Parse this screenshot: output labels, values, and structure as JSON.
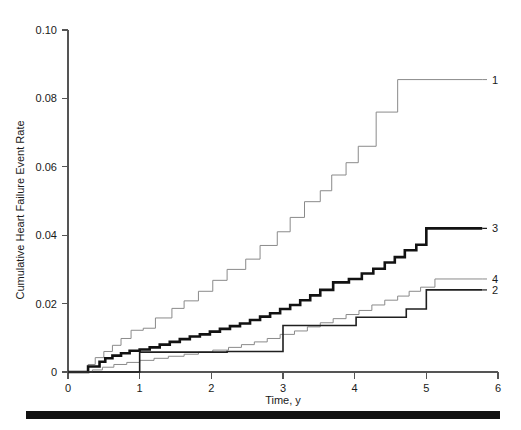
{
  "chart_data": {
    "type": "line",
    "subtype": "kaplan-meier-cumulative-event-step",
    "title": "",
    "xlabel": "Time, y",
    "ylabel": "Cumulative Heart Failure Event Rate",
    "xlim": [
      0,
      6
    ],
    "ylim": [
      0,
      0.1
    ],
    "xticks": [
      0,
      1,
      2,
      3,
      4,
      5,
      6
    ],
    "xticklabels": [
      "0",
      "1",
      "2",
      "3",
      "4",
      "5",
      "6"
    ],
    "yticks": [
      0,
      0.02,
      0.04,
      0.06,
      0.08,
      0.1
    ],
    "yticklabels": [
      "0",
      "0.02",
      "0.04",
      "0.06",
      "0.08",
      "0.10"
    ],
    "grid": false,
    "legend_position": "right-of-curve-ends",
    "series": [
      {
        "name": "1",
        "label": "1",
        "color": "#8a8a8a",
        "linewidth": 1.0,
        "final_value": 0.0855,
        "points": [
          [
            0.0,
            0.0
          ],
          [
            0.28,
            0.0
          ],
          [
            0.28,
            0.0022
          ],
          [
            0.38,
            0.0022
          ],
          [
            0.38,
            0.0042
          ],
          [
            0.5,
            0.0042
          ],
          [
            0.5,
            0.006
          ],
          [
            0.62,
            0.006
          ],
          [
            0.62,
            0.0078
          ],
          [
            0.74,
            0.0078
          ],
          [
            0.74,
            0.0098
          ],
          [
            0.88,
            0.0098
          ],
          [
            0.88,
            0.0122
          ],
          [
            1.05,
            0.0122
          ],
          [
            1.05,
            0.0128
          ],
          [
            1.22,
            0.0128
          ],
          [
            1.22,
            0.0158
          ],
          [
            1.45,
            0.0158
          ],
          [
            1.45,
            0.0186
          ],
          [
            1.62,
            0.0186
          ],
          [
            1.62,
            0.0208
          ],
          [
            1.82,
            0.0208
          ],
          [
            1.82,
            0.0236
          ],
          [
            2.02,
            0.0236
          ],
          [
            2.02,
            0.0268
          ],
          [
            2.22,
            0.0268
          ],
          [
            2.22,
            0.03
          ],
          [
            2.48,
            0.03
          ],
          [
            2.48,
            0.033
          ],
          [
            2.68,
            0.033
          ],
          [
            2.68,
            0.037
          ],
          [
            2.92,
            0.037
          ],
          [
            2.92,
            0.041
          ],
          [
            3.1,
            0.041
          ],
          [
            3.1,
            0.0452
          ],
          [
            3.3,
            0.0452
          ],
          [
            3.3,
            0.0498
          ],
          [
            3.52,
            0.0498
          ],
          [
            3.52,
            0.053
          ],
          [
            3.68,
            0.053
          ],
          [
            3.68,
            0.0576
          ],
          [
            3.88,
            0.0576
          ],
          [
            3.88,
            0.0612
          ],
          [
            4.05,
            0.0612
          ],
          [
            4.05,
            0.066
          ],
          [
            4.3,
            0.066
          ],
          [
            4.3,
            0.076
          ],
          [
            4.6,
            0.076
          ],
          [
            4.6,
            0.0855
          ],
          [
            5.78,
            0.0855
          ]
        ]
      },
      {
        "name": "3",
        "label": "3",
        "color": "#121212",
        "linewidth": 2.6,
        "final_value": 0.042,
        "points": [
          [
            0.0,
            0.0
          ],
          [
            0.28,
            0.0
          ],
          [
            0.28,
            0.0016
          ],
          [
            0.44,
            0.0016
          ],
          [
            0.44,
            0.003
          ],
          [
            0.52,
            0.003
          ],
          [
            0.52,
            0.004
          ],
          [
            0.62,
            0.004
          ],
          [
            0.62,
            0.0048
          ],
          [
            0.74,
            0.0048
          ],
          [
            0.74,
            0.0055
          ],
          [
            0.86,
            0.0055
          ],
          [
            0.86,
            0.0062
          ],
          [
            1.0,
            0.0062
          ],
          [
            1.0,
            0.0066
          ],
          [
            1.14,
            0.0066
          ],
          [
            1.14,
            0.0072
          ],
          [
            1.28,
            0.0072
          ],
          [
            1.28,
            0.008
          ],
          [
            1.42,
            0.008
          ],
          [
            1.42,
            0.0088
          ],
          [
            1.56,
            0.0088
          ],
          [
            1.56,
            0.0096
          ],
          [
            1.7,
            0.0096
          ],
          [
            1.7,
            0.0104
          ],
          [
            1.84,
            0.0104
          ],
          [
            1.84,
            0.011
          ],
          [
            1.98,
            0.011
          ],
          [
            1.98,
            0.0118
          ],
          [
            2.12,
            0.0118
          ],
          [
            2.12,
            0.0126
          ],
          [
            2.26,
            0.0126
          ],
          [
            2.26,
            0.0134
          ],
          [
            2.4,
            0.0134
          ],
          [
            2.4,
            0.0142
          ],
          [
            2.54,
            0.0142
          ],
          [
            2.54,
            0.0152
          ],
          [
            2.68,
            0.0152
          ],
          [
            2.68,
            0.0162
          ],
          [
            2.82,
            0.0162
          ],
          [
            2.82,
            0.0172
          ],
          [
            2.96,
            0.0172
          ],
          [
            2.96,
            0.0184
          ],
          [
            3.1,
            0.0184
          ],
          [
            3.1,
            0.0196
          ],
          [
            3.24,
            0.0196
          ],
          [
            3.24,
            0.021
          ],
          [
            3.38,
            0.021
          ],
          [
            3.38,
            0.0224
          ],
          [
            3.52,
            0.0224
          ],
          [
            3.52,
            0.024
          ],
          [
            3.7,
            0.024
          ],
          [
            3.7,
            0.0262
          ],
          [
            3.92,
            0.0262
          ],
          [
            3.92,
            0.0272
          ],
          [
            4.1,
            0.0272
          ],
          [
            4.1,
            0.0288
          ],
          [
            4.26,
            0.0288
          ],
          [
            4.26,
            0.0302
          ],
          [
            4.42,
            0.0302
          ],
          [
            4.42,
            0.032
          ],
          [
            4.56,
            0.032
          ],
          [
            4.56,
            0.0336
          ],
          [
            4.7,
            0.0336
          ],
          [
            4.7,
            0.0356
          ],
          [
            4.86,
            0.0356
          ],
          [
            4.86,
            0.0372
          ],
          [
            5.0,
            0.0372
          ],
          [
            5.0,
            0.042
          ],
          [
            5.78,
            0.042
          ]
        ]
      },
      {
        "name": "4",
        "label": "4",
        "color": "#8a8a8a",
        "linewidth": 1.0,
        "final_value": 0.0272,
        "points": [
          [
            0.0,
            0.0
          ],
          [
            0.34,
            0.0
          ],
          [
            0.34,
            0.0006
          ],
          [
            0.48,
            0.0006
          ],
          [
            0.48,
            0.0014
          ],
          [
            0.64,
            0.0014
          ],
          [
            0.64,
            0.0022
          ],
          [
            0.82,
            0.0022
          ],
          [
            0.82,
            0.0028
          ],
          [
            1.0,
            0.0028
          ],
          [
            1.0,
            0.0034
          ],
          [
            1.2,
            0.0034
          ],
          [
            1.2,
            0.004
          ],
          [
            1.4,
            0.004
          ],
          [
            1.4,
            0.0046
          ],
          [
            1.62,
            0.0046
          ],
          [
            1.62,
            0.0052
          ],
          [
            1.82,
            0.0052
          ],
          [
            1.82,
            0.0058
          ],
          [
            2.02,
            0.0058
          ],
          [
            2.02,
            0.0064
          ],
          [
            2.24,
            0.0064
          ],
          [
            2.24,
            0.0072
          ],
          [
            2.42,
            0.0072
          ],
          [
            2.42,
            0.008
          ],
          [
            2.6,
            0.008
          ],
          [
            2.6,
            0.0088
          ],
          [
            2.78,
            0.0088
          ],
          [
            2.78,
            0.0098
          ],
          [
            2.96,
            0.0098
          ],
          [
            2.96,
            0.011
          ],
          [
            3.16,
            0.011
          ],
          [
            3.16,
            0.012
          ],
          [
            3.34,
            0.012
          ],
          [
            3.34,
            0.0132
          ],
          [
            3.52,
            0.0132
          ],
          [
            3.52,
            0.0144
          ],
          [
            3.7,
            0.0144
          ],
          [
            3.7,
            0.0156
          ],
          [
            3.88,
            0.0156
          ],
          [
            3.88,
            0.0168
          ],
          [
            4.06,
            0.0168
          ],
          [
            4.06,
            0.018
          ],
          [
            4.24,
            0.018
          ],
          [
            4.24,
            0.0196
          ],
          [
            4.42,
            0.0196
          ],
          [
            4.42,
            0.021
          ],
          [
            4.6,
            0.021
          ],
          [
            4.6,
            0.0222
          ],
          [
            4.76,
            0.0222
          ],
          [
            4.76,
            0.0236
          ],
          [
            4.92,
            0.0236
          ],
          [
            4.92,
            0.0248
          ],
          [
            5.12,
            0.0248
          ],
          [
            5.12,
            0.0272
          ],
          [
            5.78,
            0.0272
          ]
        ]
      },
      {
        "name": "2",
        "label": "2",
        "color": "#1f1f1f",
        "linewidth": 1.6,
        "final_value": 0.024,
        "points": [
          [
            0.0,
            0.0
          ],
          [
            1.0,
            0.0
          ],
          [
            1.0,
            0.0058
          ],
          [
            2.22,
            0.0058
          ],
          [
            2.22,
            0.006
          ],
          [
            3.0,
            0.006
          ],
          [
            3.0,
            0.0136
          ],
          [
            4.02,
            0.0136
          ],
          [
            4.02,
            0.016
          ],
          [
            4.72,
            0.016
          ],
          [
            4.72,
            0.0184
          ],
          [
            5.0,
            0.0184
          ],
          [
            5.0,
            0.024
          ],
          [
            5.78,
            0.024
          ]
        ]
      }
    ],
    "curve_end_labels": [
      {
        "label": "1",
        "value": 0.0855
      },
      {
        "label": "3",
        "value": 0.042
      },
      {
        "label": "4",
        "value": 0.0272
      },
      {
        "label": "2",
        "value": 0.024
      }
    ]
  },
  "figure": {
    "bottom_rule_color": "#111111"
  }
}
